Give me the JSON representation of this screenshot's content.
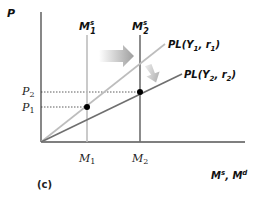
{
  "diagram": {
    "panel_label": "(c)",
    "y_axis_label": "P",
    "x_axis_label": "Ms, Md",
    "x_axis_label_parts": {
      "a": "M",
      "a_sup": "s",
      "sep": ", ",
      "b": "M",
      "b_sup": "d"
    },
    "money_supply_curves": [
      {
        "id": "M1s",
        "base": "M",
        "sup": "s",
        "sub": "1",
        "x_tick": "M",
        "x_tick_sub": "1",
        "color": "#bdbdbd"
      },
      {
        "id": "M2s",
        "base": "M",
        "sup": "s",
        "sub": "2",
        "x_tick": "M",
        "x_tick_sub": "2",
        "color": "#6f6f6f"
      }
    ],
    "price_level_lines": [
      {
        "id": "PL1",
        "label": "PL(Y",
        "sub1": "1",
        "mid": ", r",
        "sub2": "1",
        "end": ")",
        "color": "#bdbdbd"
      },
      {
        "id": "PL2",
        "label": "PL(Y",
        "sub1": "2",
        "mid": ", r",
        "sub2": "2",
        "end": ")",
        "color": "#6f6f6f"
      }
    ],
    "price_levels": [
      {
        "id": "P2",
        "base": "P",
        "sub": "2"
      },
      {
        "id": "P1",
        "base": "P",
        "sub": "1"
      }
    ],
    "equilibria": [
      {
        "id": "E1",
        "x": "M1",
        "y": "P1"
      },
      {
        "id": "E2",
        "x": "M2",
        "y": "P2"
      }
    ],
    "shift_arrows": [
      {
        "id": "supply-shift",
        "direction": "right"
      },
      {
        "id": "pl-shift",
        "direction": "down-right"
      }
    ]
  }
}
